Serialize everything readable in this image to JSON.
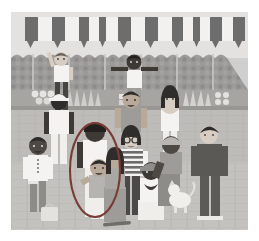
{
  "image": {
    "kind": "illustration",
    "title": "Street market crowd scene with annotation ellipse",
    "style": "flat vector illustration, desaturated greyscale",
    "canvas": {
      "width": 259,
      "height": 241
    },
    "frame": {
      "x": 11,
      "y": 12,
      "width": 237,
      "height": 218,
      "margin_color": "#ffffff"
    }
  },
  "palette": {
    "paper_white": "#ffffff",
    "sky_wall_light": "#e3e2e0",
    "awning_dark": "#6d6d6d",
    "awning_light": "#f2f1ef",
    "foliage_band": "#9b9a98",
    "foliage_dots": "#8a8987",
    "stall_counter": "#a6a5a2",
    "ground_brick": "#bdbcb9",
    "ground_line": "#aeada9",
    "skin_light": "#d8cdc2",
    "skin_mid": "#b9a998",
    "skin_dark": "#4f4944",
    "skin_deep": "#3d3935",
    "hair_black": "#2f2d2b",
    "hair_brown": "#6a635c",
    "shirt_white": "#f4f3f1",
    "shirt_grey": "#9d9c99",
    "shirt_dark": "#5a5956",
    "pants_grey": "#8d8c89",
    "pants_dark": "#4a4947",
    "accent_ellipse": "#7a3b34"
  },
  "scene": {
    "background_layers": [
      {
        "name": "sky-band",
        "label": "upper light wall",
        "color": "#e3e2e0"
      },
      {
        "name": "awning",
        "label": "striped market awning",
        "stripes": 14,
        "dark": "#6d6d6d",
        "light": "#f2f1ef",
        "scallop": "triangular valance"
      },
      {
        "name": "foliage-wall",
        "label": "textured hedge / stone wall band",
        "color": "#9b9a98"
      },
      {
        "name": "stall-counter",
        "label": "market stall counter with produce",
        "color": "#a6a5a2"
      },
      {
        "name": "ground",
        "label": "brick paved ground",
        "color": "#bdbcb9"
      }
    ],
    "stall_goods": [
      {
        "name": "produce-cluster-left",
        "label": "round fruit pile"
      },
      {
        "name": "produce-bunch-left",
        "label": "leafy greens bundle"
      },
      {
        "name": "produce-cluster-mid",
        "label": "small fruit crate"
      },
      {
        "name": "produce-bunch-right",
        "label": "banana / pepper rack"
      },
      {
        "name": "produce-dots-right",
        "label": "loose round fruit"
      }
    ],
    "people": [
      {
        "id": "p1",
        "name": "person-waving-back-left",
        "label": "adult in white tank top waving, back row left",
        "row": "back",
        "pose": "arm raised",
        "skin": "skin_light",
        "top": "shirt_white",
        "bottom": "pants_dark"
      },
      {
        "id": "p2",
        "name": "person-arms-out-back-center",
        "label": "adult in white vest with both arms out, back row center",
        "row": "back",
        "pose": "arms spread",
        "skin": "skin_deep",
        "top": "shirt_white",
        "bottom": "pants_grey"
      },
      {
        "id": "p3",
        "name": "vendor-in-white-cap",
        "label": "stall vendor in white uniform and cap",
        "row": "middle",
        "pose": "standing",
        "skin": "skin_deep",
        "top": "shirt_white",
        "bottom": "shirt_white"
      },
      {
        "id": "p4",
        "name": "person-laughing-mid-center",
        "label": "person laughing in grey shirt, middle row",
        "row": "middle",
        "pose": "standing",
        "skin": "skin_mid",
        "top": "shirt_grey",
        "bottom": "pants_grey"
      },
      {
        "id": "p5",
        "name": "woman-clapping-mid-right",
        "label": "woman with long dark hair clapping",
        "row": "middle",
        "pose": "hands together",
        "skin": "skin_light",
        "top": "shirt_white",
        "bottom": "shirt_white"
      },
      {
        "id": "p6",
        "name": "boy-white-shirt-front-left",
        "label": "boy in buttoned white shirt, front left",
        "row": "front",
        "pose": "standing",
        "skin": "skin_dark",
        "top": "shirt_white",
        "bottom": "pants_grey"
      },
      {
        "id": "p7",
        "name": "person-circled-standing",
        "label": "standing person inside the annotation ellipse",
        "row": "front",
        "pose": "standing",
        "skin": "skin_deep",
        "top": "shirt_white",
        "bottom": "shirt_white",
        "annotated": true
      },
      {
        "id": "p8",
        "name": "child-circled-waving",
        "label": "child waving inside the annotation ellipse",
        "row": "front",
        "pose": "arm raised",
        "skin": "skin_mid",
        "top": "shirt_grey",
        "bottom": "shirt_white",
        "annotated": true
      },
      {
        "id": "p9",
        "name": "girl-glasses-striped-shirt",
        "label": "girl with glasses in striped shirt",
        "row": "front",
        "pose": "standing",
        "skin": "skin_light",
        "top": "striped",
        "bottom": "pants_dark"
      },
      {
        "id": "p10",
        "name": "girl-dark-hair-front",
        "label": "girl with dark hair in grey top, front",
        "row": "front",
        "pose": "standing",
        "skin": "skin_mid",
        "top": "shirt_grey",
        "bottom": "shirt_grey"
      },
      {
        "id": "p11",
        "name": "child-seated-with-cap",
        "label": "child seated wearing a cap, hands clasped",
        "row": "front",
        "pose": "crouching",
        "skin": "skin_deep",
        "top": "shirt_white",
        "bottom": "shirt_white"
      },
      {
        "id": "p12",
        "name": "person-crouching-with-cap",
        "label": "person crouching in cap beside the dog",
        "row": "front",
        "pose": "crouching",
        "skin": "skin_dark",
        "top": "shirt_grey",
        "bottom": "pants_grey"
      },
      {
        "id": "p13",
        "name": "man-standing-right",
        "label": "man standing in dark sweater and trousers, right",
        "row": "front",
        "pose": "standing",
        "skin": "skin_light",
        "top": "shirt_dark",
        "bottom": "pants_dark"
      }
    ],
    "objects": [
      {
        "name": "dog-white",
        "label": "small white dog, front right of centre"
      },
      {
        "name": "bag-on-ground",
        "label": "pale bag on the ground, front left"
      },
      {
        "name": "skateboard",
        "label": "board lying on the ground, bottom centre"
      }
    ],
    "annotation": {
      "name": "highlight-ellipse",
      "label": "hand-drawn ellipse highlighting two figures",
      "shape": "ellipse",
      "color": "#7a3b34",
      "stroke_width": 2,
      "center": {
        "x": 84,
        "y": 158
      },
      "radius": {
        "rx": 25,
        "ry": 47
      }
    }
  }
}
